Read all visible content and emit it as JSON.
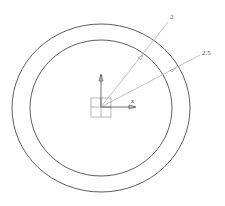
{
  "diagram": {
    "type": "cad-annulus-drawing",
    "outer_circle": {
      "cx": 101,
      "cy": 108,
      "rx": 89,
      "ry": 84,
      "stroke": "#333333"
    },
    "inner_circle": {
      "cx": 101,
      "cy": 108,
      "rx": 71,
      "ry": 68,
      "stroke": "#333333"
    },
    "dimensions": [
      {
        "label": "2",
        "target": "inner_circle"
      },
      {
        "label": "2.5",
        "target": "outer_circle"
      }
    ],
    "axes": {
      "x_label": "x",
      "y_label": "y"
    },
    "colors": {
      "line": "#333333",
      "leader": "#999999"
    }
  }
}
